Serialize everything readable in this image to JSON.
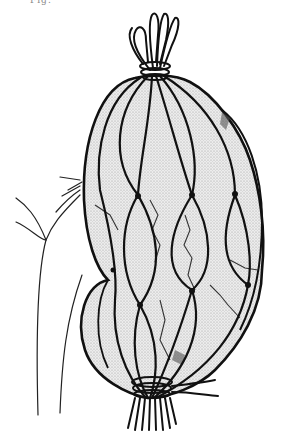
{
  "figure": {
    "label": "Fig.",
    "colors": {
      "ink": "#111111",
      "fill": "#e6e6e6",
      "background": "#ffffff"
    }
  }
}
